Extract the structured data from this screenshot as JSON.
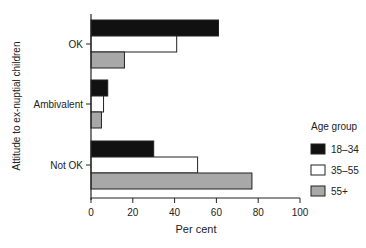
{
  "chart_data": {
    "type": "bar",
    "orientation": "horizontal",
    "title": "",
    "xlabel": "Per cent",
    "ylabel": "Attitude to ex-nuptial children",
    "xlim": [
      0,
      100
    ],
    "xticks": [
      0,
      20,
      40,
      60,
      80,
      100
    ],
    "grid": false,
    "categories": [
      "OK",
      "Ambivalent",
      "Not OK"
    ],
    "series": [
      {
        "name": "18–34",
        "color": "#111111",
        "values": [
          61,
          8,
          30
        ]
      },
      {
        "name": "35–55",
        "color": "#ffffff",
        "values": [
          41,
          6,
          51
        ]
      },
      {
        "name": "55+",
        "color": "#a8a8a8",
        "values": [
          16,
          5,
          77
        ]
      }
    ],
    "legend": {
      "title": "Age group",
      "position": "right"
    }
  }
}
